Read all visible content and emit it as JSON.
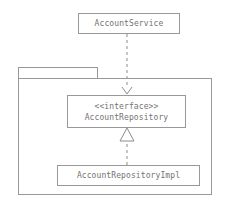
{
  "diagram": {
    "type": "uml-class-diagram",
    "background_color": "#ffffff",
    "line_color": "#999999",
    "text_color": "#737373",
    "nodes": {
      "account_service": {
        "name": "AccountService",
        "stereotype": ""
      },
      "account_repository": {
        "stereotype": "<<interface>>",
        "name": "AccountRepository"
      },
      "account_repository_impl": {
        "name": "AccountRepositoryImpl"
      }
    },
    "package": {
      "label": ""
    },
    "edges": [
      {
        "name": "dependency",
        "from": "AccountService",
        "to": "AccountRepository",
        "style": "dashed",
        "arrowhead": "open-arrow"
      },
      {
        "name": "realization",
        "from": "AccountRepositoryImpl",
        "to": "AccountRepository",
        "style": "dashed",
        "arrowhead": "hollow-triangle"
      }
    ]
  }
}
